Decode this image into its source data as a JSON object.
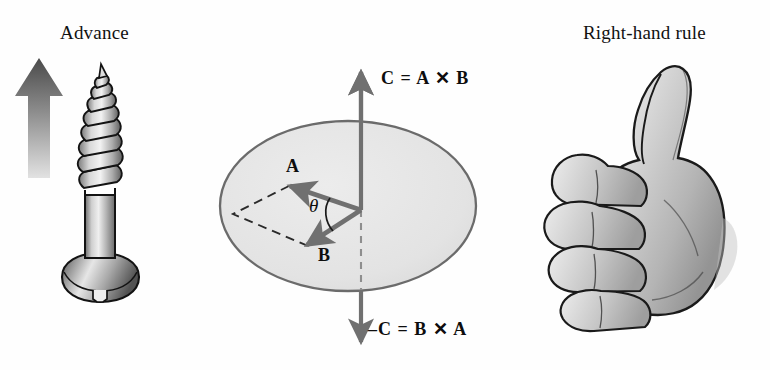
{
  "figure": {
    "background_color": "#fefefe",
    "width": 770,
    "height": 370
  },
  "panels": {
    "left": {
      "caption": "Advance",
      "arrow": {
        "name": "advance-arrow",
        "direction": "up",
        "gradient_top_color": "#4f4f4f",
        "gradient_bottom_color": "#dcdcdc"
      },
      "object": {
        "name": "screw",
        "description": "wood screw with pan head and helical threads",
        "body_color": "#b8b8b8",
        "outline_color": "#1a1a1a"
      }
    },
    "middle": {
      "plane": {
        "name": "vector-plane-ellipse",
        "fill_color": "#e4e4e4",
        "stroke_color": "#6b6b6b"
      },
      "vectors": [
        {
          "name": "vector-a",
          "label": "A",
          "direction": "up-left"
        },
        {
          "name": "vector-b",
          "label": "B",
          "direction": "down-left"
        },
        {
          "name": "vector-c",
          "label": "C",
          "direction": "up"
        },
        {
          "name": "vector-minus-c",
          "label": "-C",
          "direction": "down"
        }
      ],
      "angle": {
        "name": "theta-angle",
        "symbol": "θ",
        "between": [
          "A",
          "B"
        ]
      },
      "equations": {
        "top": "C = A ✕ B",
        "bottom": "–C = B ✕ A"
      },
      "parallelogram": {
        "name": "dashed-parallelogram",
        "style": "dashed",
        "stroke_color": "#2a2a2a"
      },
      "arrow_color": "#707070"
    },
    "right": {
      "caption": "Right-hand rule",
      "object": {
        "name": "right-hand-thumbs-up",
        "description": "right hand with curled fingers and thumb pointing up",
        "skin_color": "#cfcfcf",
        "outline_color": "#1a1a1a"
      }
    }
  }
}
